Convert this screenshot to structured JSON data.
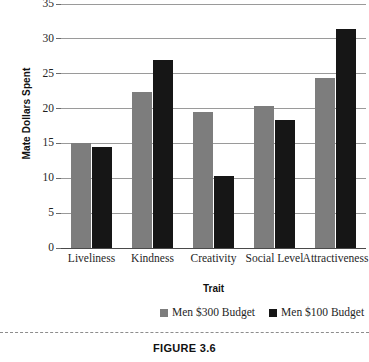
{
  "chart_data": {
    "type": "bar",
    "title": "",
    "xlabel": "Trait",
    "ylabel": "Mate Dollars Spent",
    "ylim": [
      0,
      35
    ],
    "ytick_step": 5,
    "yticks": [
      35,
      30,
      25,
      20,
      15,
      10,
      5,
      0
    ],
    "grid": true,
    "legend_position": "bottom",
    "categories": [
      "Liveliness",
      "Kindness",
      "Creativity",
      "Social Level",
      "Attractiveness"
    ],
    "series": [
      {
        "name": "Men $300 Budget",
        "color": "#7d7d7d",
        "values": [
          15.1,
          22.4,
          19.5,
          20.4,
          24.4
        ]
      },
      {
        "name": "Men $100 Budget",
        "color": "#161616",
        "values": [
          14.5,
          27.0,
          10.3,
          18.4,
          31.4
        ]
      }
    ]
  },
  "figure": {
    "caption": "FIGURE 3.6"
  },
  "colors": {
    "series_0": "#7d7d7d",
    "series_1": "#161616",
    "gridline": "#9a9a9a",
    "axis": "#4a4a4a"
  }
}
